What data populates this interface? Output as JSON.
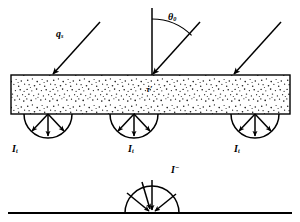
{
  "figure": {
    "domain_type": "diagram",
    "background_color": "#ffffff",
    "stroke_color": "#000000",
    "width": 300,
    "height": 222
  },
  "labels": {
    "incident_flux": {
      "symbol": "q",
      "subscript": "s",
      "text": "q"
    },
    "zenith_angle": {
      "symbol": "θ",
      "subscript": "0",
      "text": "θ"
    },
    "optical_depth": {
      "text": "τ′"
    },
    "transmitted_1": {
      "symbol": "I",
      "subscript": "t",
      "text": "I"
    },
    "transmitted_2": {
      "symbol": "I",
      "subscript": "t",
      "text": "I"
    },
    "transmitted_3": {
      "symbol": "I",
      "subscript": "t",
      "text": "I"
    },
    "downward_intensity": {
      "symbol": "I",
      "superscript": "−",
      "text": "I"
    }
  },
  "geometry": {
    "slab": {
      "x": 11,
      "y": 75,
      "width": 279,
      "height": 39,
      "fill": "stipple"
    },
    "normal_line": {
      "x": 152,
      "y_top": 8,
      "y_bottom": 75
    },
    "angle_arc": {
      "center_x": 152,
      "center_y": 75,
      "radius": 58,
      "from_deg": 90,
      "to_deg": 45
    },
    "incident_rays": [
      {
        "x1": 100,
        "y1": 22,
        "x2": 52,
        "y2": 75
      },
      {
        "x1": 200,
        "y1": 22,
        "x2": 152,
        "y2": 75
      },
      {
        "x1": 281,
        "y1": 22,
        "x2": 233,
        "y2": 75
      }
    ],
    "emission_lobes": [
      {
        "center_x": 48,
        "center_y": 114,
        "radius": 24,
        "arrows": 3,
        "direction": "down"
      },
      {
        "center_x": 134,
        "center_y": 114,
        "radius": 24,
        "arrows": 3,
        "direction": "down"
      },
      {
        "center_x": 255,
        "center_y": 114,
        "radius": 24,
        "arrows": 3,
        "direction": "down"
      }
    ],
    "ground_line": {
      "x1": 8,
      "y1": 213,
      "x2": 292,
      "y2": 213
    },
    "incoming_lobe": {
      "center_x": 152,
      "center_y": 213,
      "radius": 27,
      "arrows": 4,
      "direction": "converge"
    }
  }
}
